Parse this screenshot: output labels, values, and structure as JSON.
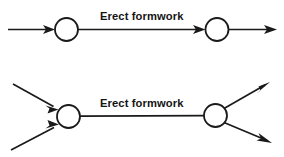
{
  "figure": {
    "background_color": "#ffffff",
    "line_color": "#1a1a1a",
    "node_fill_color": "#ffffff",
    "width": 284,
    "height": 157
  },
  "diagrams": [
    {
      "id": "top-fragment",
      "name": "single-predecessor-single-successor",
      "label": "Erect formwork",
      "nodes": [
        {
          "id": "top-node-start",
          "cx": 66.5,
          "cy": 29.5,
          "r": 11.5
        },
        {
          "id": "top-node-end",
          "cx": 217,
          "cy": 29.5,
          "r": 11.5
        }
      ],
      "edges": [
        {
          "id": "top-edge-in",
          "from_x": 8,
          "from_y": 29.5,
          "to_x": 55,
          "to_y": 29.5,
          "arrow": true
        },
        {
          "id": "top-edge-activity",
          "from_x": 78,
          "from_y": 29.5,
          "to_x": 205.5,
          "to_y": 29.5,
          "arrow": true
        },
        {
          "id": "top-edge-out",
          "from_x": 228.5,
          "from_y": 29.5,
          "to_x": 277,
          "to_y": 29.5,
          "arrow": true
        }
      ]
    },
    {
      "id": "bottom-fragment",
      "name": "two-predecessors-two-successors",
      "label": "Erect formwork",
      "nodes": [
        {
          "id": "bottom-node-start",
          "cx": 68.5,
          "cy": 116.5,
          "r": 11.5
        },
        {
          "id": "bottom-node-end",
          "cx": 215.5,
          "cy": 115.5,
          "r": 11.5
        }
      ],
      "edges": [
        {
          "id": "bottom-edge-in-upper",
          "from_x": 13,
          "from_y": 84,
          "to_x": 58.5,
          "to_y": 109.5,
          "arrow": true
        },
        {
          "id": "bottom-edge-in-lower",
          "from_x": 11,
          "from_y": 150,
          "to_x": 59,
          "to_y": 124.5,
          "arrow": true
        },
        {
          "id": "bottom-edge-activity",
          "from_x": 80,
          "from_y": 116,
          "to_x": 204,
          "to_y": 115.5,
          "arrow": false
        },
        {
          "id": "bottom-edge-out-upper",
          "from_x": 224,
          "from_y": 108.5,
          "to_x": 270,
          "to_y": 82,
          "arrow": true
        },
        {
          "id": "bottom-edge-out-lower",
          "from_x": 224,
          "from_y": 122.5,
          "to_x": 272,
          "to_y": 143,
          "arrow": true
        }
      ]
    }
  ],
  "labels": {
    "top": "Erect formwork",
    "bottom": "Erect formwork"
  }
}
